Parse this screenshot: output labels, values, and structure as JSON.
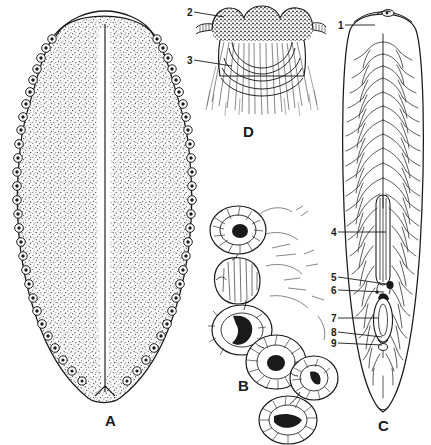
{
  "figure": {
    "background_color": "#ffffff",
    "ink_color": "#1a1a1a",
    "width": 431,
    "height": 445
  },
  "panels": [
    {
      "letter": "A",
      "name": "whole-body-ventral-view",
      "description": "Entire flattened body, stippled, with chain of ring-like marginal bodies along both margins and a pale median longitudinal channel",
      "letter_x": 105,
      "letter_y": 413
    },
    {
      "letter": "B",
      "name": "sucker-cluster-detail",
      "description": "Cluster of six cup-shaped muscular suckers drawn with radial hatching",
      "letter_x": 238,
      "letter_y": 378
    },
    {
      "letter": "C",
      "name": "internal-anatomy-view",
      "description": "Elongate body showing dendritic branched gut caeca, uterus, ovary, testes and genital pore",
      "letter_x": 378,
      "letter_y": 418
    },
    {
      "letter": "D",
      "name": "anterior-end-detail",
      "description": "Enlarged anterior end with granular tissue and radiating muscle fibres",
      "letter_x": 243,
      "letter_y": 124
    }
  ],
  "leader_labels": [
    {
      "id": "1",
      "panel": "C",
      "num_x": 338,
      "num_y": 21,
      "line_x1": 345,
      "line_y1": 25,
      "line_x2": 375,
      "line_y2": 25
    },
    {
      "id": "2",
      "panel": "D",
      "num_x": 187,
      "num_y": 8,
      "line_x1": 194,
      "line_y1": 12,
      "line_x2": 224,
      "line_y2": 17
    },
    {
      "id": "3",
      "panel": "D",
      "num_x": 187,
      "num_y": 56,
      "line_x1": 194,
      "line_y1": 60,
      "line_x2": 232,
      "line_y2": 66
    },
    {
      "id": "4",
      "panel": "C",
      "num_x": 331,
      "num_y": 228,
      "line_x1": 338,
      "line_y1": 232,
      "line_x2": 386,
      "line_y2": 232
    },
    {
      "id": "5",
      "panel": "C",
      "num_x": 331,
      "num_y": 273,
      "line_x1": 338,
      "line_y1": 277,
      "line_x2": 386,
      "line_y2": 284
    },
    {
      "id": "6",
      "panel": "C",
      "num_x": 331,
      "num_y": 286,
      "line_x1": 338,
      "line_y1": 290,
      "line_x2": 384,
      "line_y2": 292
    },
    {
      "id": "7",
      "panel": "C",
      "num_x": 331,
      "num_y": 314,
      "line_x1": 338,
      "line_y1": 318,
      "line_x2": 378,
      "line_y2": 318
    },
    {
      "id": "8",
      "panel": "C",
      "num_x": 331,
      "num_y": 328,
      "line_x1": 338,
      "line_y1": 332,
      "line_x2": 382,
      "line_y2": 337
    },
    {
      "id": "9",
      "panel": "C",
      "num_x": 331,
      "num_y": 339,
      "line_x1": 338,
      "line_y1": 343,
      "line_x2": 382,
      "line_y2": 345
    }
  ]
}
